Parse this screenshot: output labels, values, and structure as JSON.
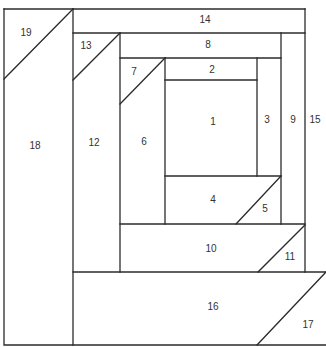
{
  "diagram": {
    "type": "log-cabin-style paper piecing block",
    "line_color": "#2b2b2b",
    "background": "#ffffff",
    "pieces": [
      {
        "id": "1",
        "label": "1",
        "x": 213,
        "y": 122
      },
      {
        "id": "2",
        "label": "2",
        "x": 212,
        "y": 70
      },
      {
        "id": "3",
        "label": "3",
        "x": 267,
        "y": 120
      },
      {
        "id": "4",
        "label": "4",
        "x": 213,
        "y": 200
      },
      {
        "id": "5",
        "label": "5",
        "x": 265,
        "y": 209
      },
      {
        "id": "6",
        "label": "6",
        "x": 144,
        "y": 142
      },
      {
        "id": "7",
        "label": "7",
        "x": 134,
        "y": 72
      },
      {
        "id": "8",
        "label": "8",
        "x": 208,
        "y": 45
      },
      {
        "id": "9",
        "label": "9",
        "x": 293,
        "y": 120
      },
      {
        "id": "10",
        "label": "10",
        "x": 211,
        "y": 249
      },
      {
        "id": "11",
        "label": "11",
        "x": 290,
        "y": 257
      },
      {
        "id": "12",
        "label": "12",
        "x": 94,
        "y": 143
      },
      {
        "id": "13",
        "label": "13",
        "x": 86,
        "y": 46
      },
      {
        "id": "14",
        "label": "14",
        "x": 205,
        "y": 20
      },
      {
        "id": "15",
        "label": "15",
        "x": 315,
        "y": 120
      },
      {
        "id": "16",
        "label": "16",
        "x": 213,
        "y": 307
      },
      {
        "id": "17",
        "label": "17",
        "x": 308,
        "y": 325
      },
      {
        "id": "18",
        "label": "18",
        "x": 35,
        "y": 146
      },
      {
        "id": "19",
        "label": "19",
        "x": 26,
        "y": 33
      }
    ]
  }
}
